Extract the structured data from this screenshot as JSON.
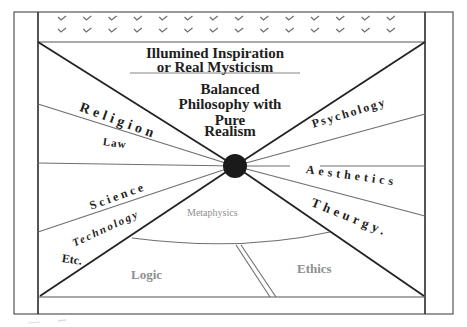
{
  "title": {
    "line1": "Illumined Inspiration",
    "line2": "or Real Mysticism"
  },
  "center_text": {
    "line1": "Balanced",
    "line2": "Philosophy with",
    "line3": "Pure",
    "line4": "Realism"
  },
  "left_labels": {
    "religion": "Religion",
    "law": "Law",
    "science": "Science",
    "technology": "Technology",
    "etc": "Etc."
  },
  "right_labels": {
    "psychology": "Psychology",
    "aesthetics": "Aesthetics",
    "theurgy": "Theurgy."
  },
  "bottom_labels": {
    "metaphysics": "Metaphysics",
    "logic": "Logic",
    "ethics": "Ethics"
  },
  "header_band": {
    "icon": "checkmark-icon",
    "columns": 14,
    "rows": 2
  },
  "colors": {
    "line": "#2a2a2a",
    "gray_line": "#6e6e6e",
    "gray_text": "#8f8f8f",
    "circle": "#1a1a1a"
  }
}
